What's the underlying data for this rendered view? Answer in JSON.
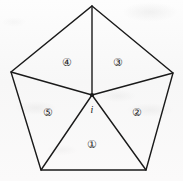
{
  "figure": {
    "canvas": {
      "width": 183,
      "height": 181
    },
    "colors": {
      "stroke": "#1a1a1a",
      "background": "#fbfbfb",
      "label_text": "#1d1d1d"
    },
    "stroke_width": 1.4,
    "outline": {
      "name": "pentagon-outline",
      "vertices": [
        {
          "name": "vertex-top",
          "x": 92,
          "y": 6
        },
        {
          "name": "vertex-right",
          "x": 173,
          "y": 73
        },
        {
          "name": "vertex-bottom-right",
          "x": 146,
          "y": 170
        },
        {
          "name": "vertex-bottom-left",
          "x": 41,
          "y": 170
        },
        {
          "name": "vertex-left",
          "x": 11,
          "y": 72
        }
      ]
    },
    "interior_point": {
      "name": "interior-point-i",
      "x": 92,
      "y": 95,
      "dot_radius": 2.1,
      "label": "i",
      "label_x": 92,
      "label_y": 110
    },
    "spokes": [
      {
        "name": "spoke-to-top",
        "x1": 92,
        "y1": 95,
        "x2": 92,
        "y2": 6
      },
      {
        "name": "spoke-to-right",
        "x1": 92,
        "y1": 95,
        "x2": 173,
        "y2": 73
      },
      {
        "name": "spoke-to-bottom-right",
        "x1": 92,
        "y1": 95,
        "x2": 146,
        "y2": 170
      },
      {
        "name": "spoke-to-bottom-left",
        "x1": 92,
        "y1": 95,
        "x2": 41,
        "y2": 170
      },
      {
        "name": "spoke-to-left",
        "x1": 92,
        "y1": 95,
        "x2": 11,
        "y2": 72
      }
    ],
    "region_labels": [
      {
        "name": "region-label-1",
        "text": "①",
        "x": 92,
        "y": 144
      },
      {
        "name": "region-label-2",
        "text": "②",
        "x": 137,
        "y": 112
      },
      {
        "name": "region-label-3",
        "text": "③",
        "x": 118,
        "y": 62
      },
      {
        "name": "region-label-4",
        "text": "④",
        "x": 67,
        "y": 62
      },
      {
        "name": "region-label-5",
        "text": "⑤",
        "x": 48,
        "y": 112
      }
    ]
  }
}
